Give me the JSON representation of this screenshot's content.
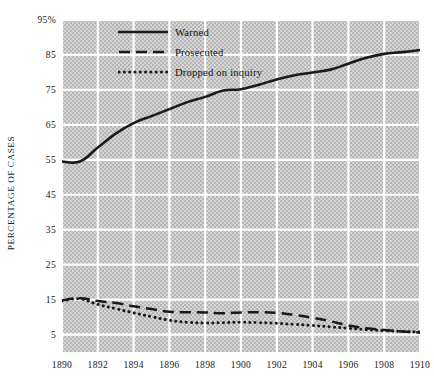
{
  "chart_data": {
    "type": "line",
    "title": "",
    "xlabel": "",
    "ylabel": "PERCENTAGE OF CASES",
    "xlim": [
      1890,
      1910
    ],
    "ylim": [
      0,
      95
    ],
    "grid": true,
    "legend_position": "top-left-inside",
    "x_tick_labels": [
      "1890",
      "1892",
      "1894",
      "1896",
      "1898",
      "1900",
      "1902",
      "1904",
      "1906",
      "1908",
      "1910"
    ],
    "x_ticks": [
      1890,
      1892,
      1894,
      1896,
      1898,
      1900,
      1902,
      1904,
      1906,
      1908,
      1910
    ],
    "y_tick_labels": [
      "95%",
      "85",
      "75",
      "65",
      "55",
      "45",
      "35",
      "25",
      "15",
      "5"
    ],
    "y_ticks": [
      95,
      85,
      75,
      65,
      55,
      45,
      35,
      25,
      15,
      5
    ],
    "x": [
      1890,
      1891,
      1892,
      1893,
      1894,
      1895,
      1896,
      1897,
      1898,
      1899,
      1900,
      1901,
      1902,
      1903,
      1904,
      1905,
      1906,
      1907,
      1908,
      1909,
      1910
    ],
    "series": [
      {
        "name": "Warned",
        "style": "solid",
        "color": "#1a1a1a",
        "values": [
          54.5,
          54.5,
          58.5,
          62.5,
          65.5,
          67.5,
          69.5,
          71.5,
          73.0,
          74.8,
          75.2,
          76.5,
          78.0,
          79.2,
          80.0,
          80.8,
          82.5,
          84.2,
          85.3,
          85.8,
          86.4
        ]
      },
      {
        "name": "Prosecuted",
        "style": "dashed",
        "color": "#1a1a1a",
        "values": [
          14.8,
          15.4,
          14.6,
          14.0,
          13.1,
          12.3,
          11.5,
          11.4,
          11.3,
          11.1,
          11.3,
          11.4,
          11.2,
          10.6,
          9.8,
          8.8,
          7.6,
          6.8,
          6.3,
          5.9,
          5.6
        ]
      },
      {
        "name": "Dropped on inquiry",
        "style": "dotted",
        "color": "#1a1a1a",
        "values": [
          14.6,
          15.2,
          13.6,
          12.4,
          11.2,
          10.1,
          9.1,
          8.5,
          8.3,
          8.4,
          8.5,
          8.4,
          8.2,
          7.9,
          7.6,
          7.2,
          6.8,
          6.4,
          6.1,
          5.9,
          5.7
        ]
      }
    ]
  },
  "legend": {
    "items": [
      {
        "label": "Warned",
        "style": "solid"
      },
      {
        "label": "Prosecuted",
        "style": "dashed"
      },
      {
        "label": "Dropped on inquiry",
        "style": "dotted"
      }
    ]
  },
  "colors": {
    "line": "#1a1a1a",
    "gridline": "#ffffff",
    "plot_background": "#c5c5c5",
    "page_background": "#ffffff",
    "text": "#1a1a1a"
  }
}
